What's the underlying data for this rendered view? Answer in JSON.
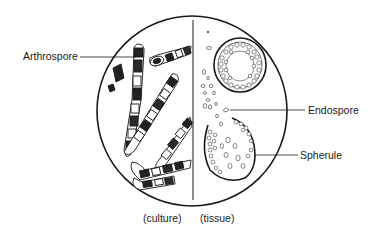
{
  "diagram": {
    "type": "microscopy-illustration",
    "field": {
      "shape": "circle",
      "center": [
        192,
        111
      ],
      "radius": 95,
      "divider_x": 193
    },
    "panels": [
      {
        "id": "culture",
        "caption": "(culture)",
        "side": "left"
      },
      {
        "id": "tissue",
        "caption": "(tissue)",
        "side": "right"
      }
    ],
    "labels": {
      "arthrospore": "Arthrospore",
      "endospore": "Endospore",
      "spherule": "Spherule"
    },
    "colors": {
      "ink": "#1a1a1a",
      "background": "#ffffff"
    }
  }
}
